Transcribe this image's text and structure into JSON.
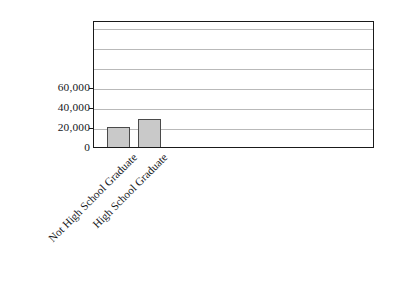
{
  "chart_data": {
    "type": "bar",
    "title": "",
    "subtitle": "",
    "xlabel": "",
    "ylabel": "",
    "categories": [
      "Not High School Graduate",
      "High School Graduate"
    ],
    "values": [
      20000,
      28000
    ],
    "series": [
      {
        "name": "",
        "values": [
          20000,
          28000
        ]
      }
    ],
    "ylim": [
      0,
      127000
    ],
    "ytick_labels": [
      "0",
      "20,000",
      "40,000",
      "60,000"
    ],
    "ytick_values": [
      0,
      20000,
      40000,
      60000
    ],
    "gridline_values": [
      20000,
      40000,
      60000,
      80000,
      100000,
      120000
    ],
    "grid": true,
    "legend": "none",
    "bar_fill_color": "#c9c9c9",
    "bar_border_color": "#4a4a4a",
    "gridline_color": "#b9b9b9",
    "axis_color": "#1a1a1a",
    "background_color": "#ffffff",
    "x_label_rotation_degrees": -45
  }
}
